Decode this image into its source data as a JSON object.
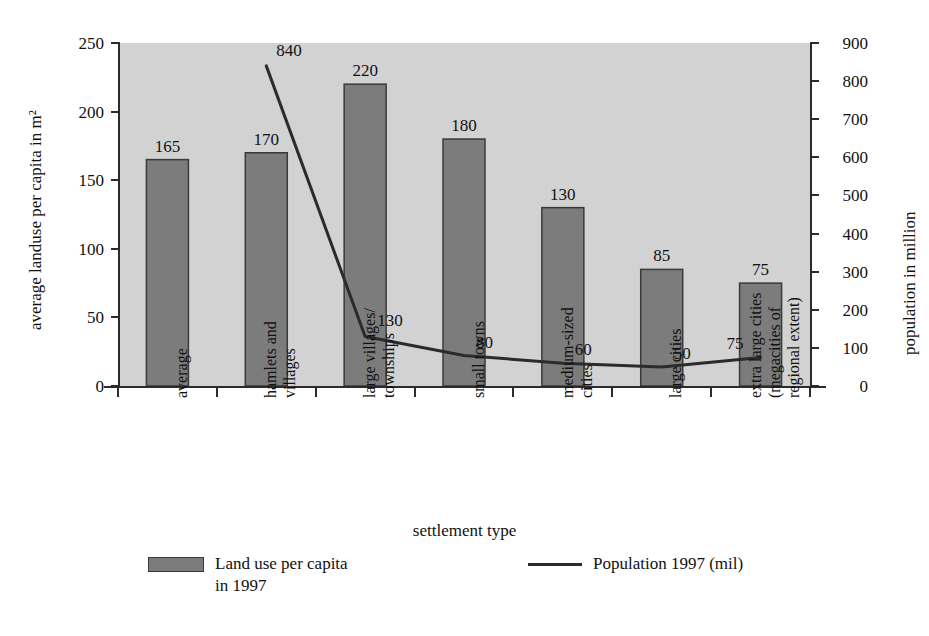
{
  "chart_data": {
    "type": "bar",
    "title": "",
    "subtitle": "",
    "xlabel": "settlement type",
    "ylabel": "average landuse per capita in m²",
    "y2label": "population in million",
    "ylim": [
      0,
      250
    ],
    "y2lim": [
      0,
      900
    ],
    "yticks": [
      "0",
      "50",
      "100",
      "150",
      "200",
      "250"
    ],
    "ytick_values": [
      0,
      50,
      100,
      150,
      200,
      250
    ],
    "y2ticks": [
      "0",
      "100",
      "200",
      "300",
      "400",
      "500",
      "600",
      "700",
      "800",
      "900"
    ],
    "y2tick_values": [
      0,
      100,
      200,
      300,
      400,
      500,
      600,
      700,
      800,
      900
    ],
    "grid": false,
    "legend_position": "bottom",
    "categories": [
      "average",
      "hamlets and villages",
      "large villages/ townships",
      "small towns",
      "medium-sized cities",
      "large cities",
      "extra large cities (megacities of regional extent)"
    ],
    "category_lines": [
      [
        "average"
      ],
      [
        "hamlets and",
        "villages"
      ],
      [
        "large villages/",
        "townships"
      ],
      [
        "small towns"
      ],
      [
        "medium-sized",
        "cities"
      ],
      [
        "large cities"
      ],
      [
        "extra large cities",
        "(megacities of",
        "regional extent)"
      ]
    ],
    "series": [
      {
        "name": "Land use per capita in 1997",
        "type": "bar",
        "axis": "left",
        "unit": "m²",
        "color": "#7c7c7c",
        "edge_color": "#3a3a3a",
        "values": [
          165,
          170,
          220,
          180,
          130,
          85,
          75
        ],
        "labels": [
          "165",
          "170",
          "220",
          "180",
          "130",
          "85",
          "75"
        ]
      },
      {
        "name": "Population 1997 (mil)",
        "type": "line",
        "axis": "right",
        "unit": "million",
        "color": "#2b2b2b",
        "values": [
          null,
          840,
          130,
          80,
          60,
          50,
          75
        ],
        "labels": [
          "",
          "840",
          "130",
          "80",
          "60",
          "50",
          "75"
        ]
      }
    ]
  },
  "legend": {
    "items": [
      {
        "label": "Land use per capita\nin 1997",
        "marker": "swatch"
      },
      {
        "label": "Population 1997 (mil)",
        "marker": "line"
      }
    ]
  },
  "colors": {
    "plot_background": "#d2d2d2",
    "bar_fill": "#7c7c7c",
    "bar_edge": "#3a3a3a",
    "line": "#2b2b2b",
    "axis": "#2b2b2b",
    "text": "#111111",
    "page_background": "#ffffff"
  }
}
